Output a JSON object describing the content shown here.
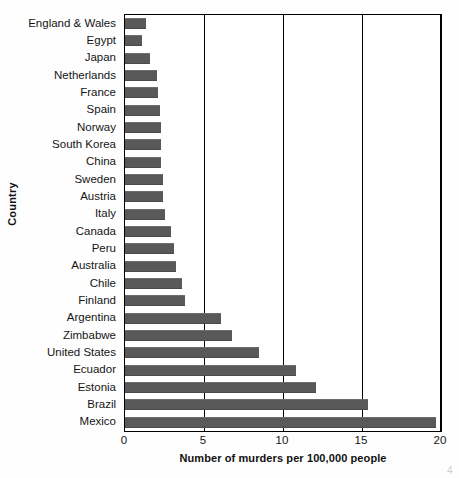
{
  "chart_data": {
    "type": "bar",
    "orientation": "horizontal",
    "title": "",
    "xlabel": "Number of murders per 100,000 people",
    "ylabel": "Country",
    "xlim": [
      0,
      20
    ],
    "xticks": [
      0,
      5,
      10,
      15,
      20
    ],
    "xtick_labels": [
      "0",
      "5",
      "10",
      "15",
      "20"
    ],
    "grid": "vertical",
    "legend": "none",
    "bar_color": "#595959",
    "categories": [
      "England & Wales",
      "Egypt",
      "Japan",
      "Netherlands",
      "France",
      "Spain",
      "Norway",
      "South Korea",
      "China",
      "Sweden",
      "Austria",
      "Italy",
      "Canada",
      "Peru",
      "Australia",
      "Chile",
      "Finland",
      "Argentina",
      "Zimbabwe",
      "United States",
      "Ecuador",
      "Estonia",
      "Brazil",
      "Mexico"
    ],
    "values": [
      1.3,
      1.1,
      1.6,
      2.0,
      2.1,
      2.2,
      2.3,
      2.3,
      2.3,
      2.4,
      2.4,
      2.5,
      2.9,
      3.1,
      3.2,
      3.6,
      3.8,
      6.1,
      6.8,
      8.5,
      10.8,
      12.1,
      15.4,
      19.7
    ]
  },
  "axis": {
    "y_caption": "Country",
    "x_caption": "Number of murders per 100,000 people"
  },
  "artifacts": {
    "corner_mark": "4"
  }
}
